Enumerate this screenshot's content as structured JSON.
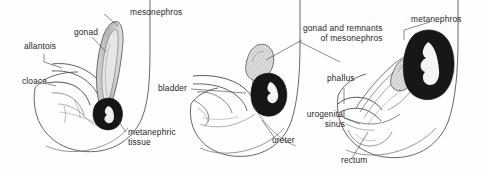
{
  "figure": {
    "background_color": "#fefefe",
    "ink_color": "#26262a",
    "organ_dark_color": "#1a1a1a",
    "organ_gray_color": "#9a9a9a",
    "organ_light_color": "#d8d8d8",
    "panel_count": 3
  },
  "panels": [
    {
      "id": "panel-early",
      "name": "early-stage",
      "labels": [
        {
          "key": "mesonephros",
          "text": "mesonephros"
        },
        {
          "key": "gonad",
          "text": "gonad"
        },
        {
          "key": "allantois",
          "text": "allantois"
        },
        {
          "key": "cloaca",
          "text": "cloaca"
        },
        {
          "key": "metanephric_tissue",
          "text": "metanephric\ntissue"
        },
        {
          "key": "metanephric_tissue_l1",
          "text": "metanephric"
        },
        {
          "key": "metanephric_tissue_l2",
          "text": "tissue"
        }
      ]
    },
    {
      "id": "panel-middle",
      "name": "intermediate-stage",
      "labels": [
        {
          "key": "bladder",
          "text": "bladder"
        },
        {
          "key": "ureter",
          "text": "ureter"
        }
      ]
    },
    {
      "id": "panel-late",
      "name": "late-stage",
      "labels": [
        {
          "key": "gonad_remnants_l1",
          "text": "gonad and remnants"
        },
        {
          "key": "gonad_remnants_l2",
          "text": "of mesonephros"
        },
        {
          "key": "metanephros",
          "text": "metanephros"
        },
        {
          "key": "phallus",
          "text": "phallus"
        },
        {
          "key": "urogenital_sinus_l1",
          "text": "urogenital"
        },
        {
          "key": "urogenital_sinus_l2",
          "text": "sinus"
        },
        {
          "key": "rectum",
          "text": "rectum"
        }
      ]
    }
  ],
  "text": {
    "mesonephros": "mesonephros",
    "gonad": "gonad",
    "allantois": "allantois",
    "cloaca": "cloaca",
    "metanephric_l1": "metanephric",
    "metanephric_l2": "tissue",
    "bladder": "bladder",
    "ureter": "ureter",
    "gonad_remnants_l1": "gonad and remnants",
    "gonad_remnants_l2": "of mesonephros",
    "metanephros": "metanephros",
    "phallus": "phallus",
    "urogenital_l1": "urogenital",
    "urogenital_l2": "sinus",
    "rectum": "rectum"
  }
}
